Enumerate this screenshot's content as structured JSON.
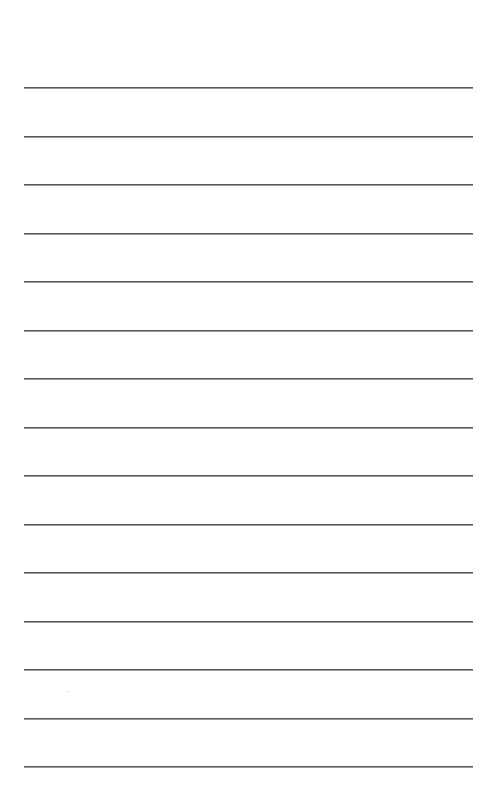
{
  "page": {
    "type": "lined-paper",
    "background": "#ffffff",
    "line_color": "#5a5a5a",
    "line_count": 15,
    "line_left": 24,
    "line_right": 473,
    "line_positions_y": [
      87,
      136,
      184,
      233,
      281,
      330,
      378,
      427,
      475,
      524,
      572,
      621,
      669,
      718,
      766
    ]
  }
}
